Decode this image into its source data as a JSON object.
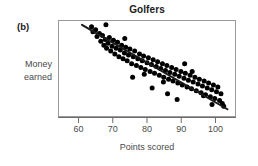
{
  "figure": {
    "panel_label": "(b)",
    "title": "Golfers",
    "y_axis_label_line1": "Money",
    "y_axis_label_line2": "earned",
    "x_axis_label": "Points scored"
  },
  "colors": {
    "point": "#000000",
    "trend_line": "#1a1a1a",
    "axis": "#6b6b6b",
    "frame": "#9a9a9a",
    "text": "#4a4a4a",
    "title_text": "#1a1a1a"
  },
  "chart_data": {
    "type": "scatter",
    "title": "Golfers",
    "xlabel": "Points scored",
    "ylabel": "Money earned",
    "xlim": [
      54,
      106
    ],
    "ylim": [
      0,
      100
    ],
    "grid": false,
    "legend": null,
    "xticks": [
      60,
      70,
      80,
      90,
      100
    ],
    "xtick_labels": [
      "60",
      "70",
      "80",
      "90",
      "100"
    ],
    "yticks": [],
    "ytick_labels": [],
    "trend_line": {
      "type": "linear-fit",
      "x_start": 61.0,
      "y_start": 95.0,
      "x_end": 103.5,
      "y_end": 8.0
    },
    "x": [
      63.8,
      64.2,
      65.0,
      65.4,
      66.1,
      66.5,
      67.0,
      67.4,
      67.8,
      68.2,
      68.6,
      69.0,
      69.4,
      69.8,
      70.2,
      70.6,
      71.0,
      71.4,
      71.8,
      72.2,
      72.6,
      73.0,
      73.4,
      73.8,
      74.2,
      74.6,
      75.0,
      75.5,
      76.0,
      76.4,
      76.9,
      77.3,
      77.8,
      78.2,
      78.6,
      79.0,
      79.5,
      80.0,
      80.4,
      80.9,
      81.3,
      81.8,
      82.2,
      82.7,
      83.1,
      83.6,
      84.0,
      84.5,
      84.9,
      85.4,
      85.8,
      86.3,
      86.7,
      87.2,
      87.6,
      88.1,
      88.5,
      89.0,
      89.4,
      89.9,
      90.3,
      90.8,
      91.2,
      91.7,
      92.1,
      92.6,
      93.0,
      93.5,
      94.0,
      94.4,
      94.9,
      95.3,
      95.8,
      96.2,
      96.7,
      97.1,
      97.6,
      98.0,
      98.5,
      98.9,
      99.4,
      99.8,
      100.3,
      100.7,
      101.2,
      101.6,
      102.0,
      102.4,
      68.0,
      73.5,
      79.2,
      84.8,
      91.0,
      86.0,
      75.8,
      81.5,
      88.8,
      93.2,
      96.5,
      99.0
    ],
    "y": [
      93.0,
      88.0,
      90.0,
      83.0,
      86.0,
      78.0,
      84.0,
      74.0,
      80.0,
      71.0,
      76.0,
      82.0,
      68.0,
      73.0,
      79.0,
      65.0,
      71.0,
      77.0,
      62.0,
      69.0,
      74.0,
      60.0,
      66.0,
      72.0,
      58.0,
      64.0,
      70.0,
      55.0,
      62.0,
      68.0,
      53.0,
      60.0,
      65.0,
      51.0,
      58.0,
      63.0,
      49.0,
      56.0,
      61.0,
      47.0,
      54.0,
      59.0,
      45.0,
      52.0,
      57.0,
      43.0,
      50.0,
      55.0,
      41.0,
      48.0,
      53.0,
      39.0,
      46.0,
      51.0,
      37.0,
      44.0,
      49.0,
      35.0,
      42.0,
      47.0,
      33.0,
      40.0,
      45.0,
      31.0,
      38.0,
      43.0,
      29.0,
      36.0,
      41.0,
      27.0,
      34.0,
      39.0,
      25.0,
      32.0,
      37.0,
      23.0,
      30.0,
      35.0,
      21.0,
      28.0,
      33.0,
      19.0,
      26.0,
      31.0,
      17.0,
      24.0,
      14.0,
      11.0,
      95.0,
      81.0,
      44.0,
      36.0,
      55.0,
      24.0,
      41.0,
      30.0,
      18.0,
      47.0,
      22.0,
      13.0
    ]
  }
}
